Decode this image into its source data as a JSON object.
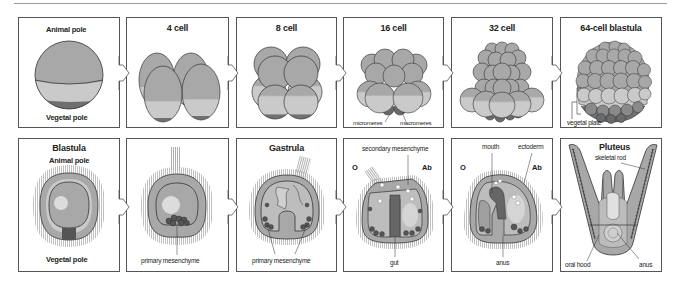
{
  "figure": {
    "top_row": [
      {
        "id": "egg",
        "title": "",
        "labels": {
          "top": "Animal pole",
          "bottom": "Vegetal pole"
        }
      },
      {
        "id": "4cell",
        "title": "4 cell"
      },
      {
        "id": "8cell",
        "title": "8 cell"
      },
      {
        "id": "16cell",
        "title": "16 cell",
        "labels": {
          "left": "micromeres",
          "right": "macromeres"
        }
      },
      {
        "id": "32cell",
        "title": "32 cell"
      },
      {
        "id": "64cell",
        "title": "64-cell blastula",
        "labels": {
          "bracket": "vegetal plate"
        }
      }
    ],
    "bottom_row": [
      {
        "id": "blastula",
        "title": "Blastula",
        "labels": {
          "top": "Animal pole",
          "bottom": "Vegetal pole"
        }
      },
      {
        "id": "ingression",
        "title": "",
        "labels": {
          "bottom": "primary mesenchyme"
        }
      },
      {
        "id": "gastrula",
        "title": "Gastrula",
        "labels": {
          "bottom": "primary mesenchyme"
        }
      },
      {
        "id": "prism",
        "title": "",
        "labels": {
          "top": "secondary mesenchyme",
          "oral": "O",
          "aboral": "Ab",
          "bottom": "gut"
        }
      },
      {
        "id": "early_larva",
        "title": "",
        "labels": {
          "mouth": "mouth",
          "ectoderm": "ectoderm",
          "oral": "O",
          "aboral": "Ab",
          "bottom": "anus"
        }
      },
      {
        "id": "pluteus",
        "title": "Pluteus",
        "labels": {
          "rod": "skeletal rod",
          "hood": "oral hood",
          "anus": "anus"
        }
      }
    ],
    "colors": {
      "animal": "#a6a6a6",
      "vegetal": "#c9c9c9",
      "micromere": "#6e6e6e",
      "outline": "#333333",
      "cilia": "#b5b5b5",
      "cavity": "#d8d8d8"
    }
  }
}
